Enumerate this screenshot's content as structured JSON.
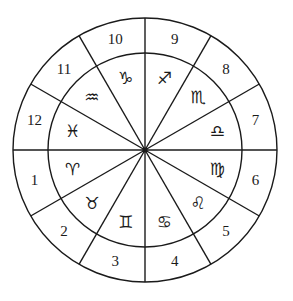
{
  "diagram": {
    "title": "",
    "type": "astrological-house-wheel",
    "center": [
      145,
      150
    ],
    "outer_radius": 132,
    "inner_radius": 97,
    "line_color": "#1a1a1a",
    "houses": [
      {
        "label": "1",
        "angle_deg": 195
      },
      {
        "label": "2",
        "angle_deg": 225
      },
      {
        "label": "3",
        "angle_deg": 255
      },
      {
        "label": "4",
        "angle_deg": 285
      },
      {
        "label": "5",
        "angle_deg": 315
      },
      {
        "label": "6",
        "angle_deg": 345
      },
      {
        "label": "7",
        "angle_deg": 15
      },
      {
        "label": "8",
        "angle_deg": 45
      },
      {
        "label": "9",
        "angle_deg": 75
      },
      {
        "label": "10",
        "angle_deg": 105
      },
      {
        "label": "11",
        "angle_deg": 135
      },
      {
        "label": "12",
        "angle_deg": 165
      }
    ],
    "signs": [
      {
        "name": "aries",
        "glyph": "♈",
        "angle_deg": 195
      },
      {
        "name": "taurus",
        "glyph": "♉",
        "angle_deg": 225
      },
      {
        "name": "gemini",
        "glyph": "♊",
        "angle_deg": 255
      },
      {
        "name": "cancer",
        "glyph": "♋",
        "angle_deg": 285
      },
      {
        "name": "leo",
        "glyph": "♌",
        "angle_deg": 315
      },
      {
        "name": "virgo",
        "glyph": "♍",
        "angle_deg": 345
      },
      {
        "name": "libra",
        "glyph": "♎",
        "angle_deg": 15
      },
      {
        "name": "scorpio",
        "glyph": "♏",
        "angle_deg": 45
      },
      {
        "name": "sagittarius",
        "glyph": "♐",
        "angle_deg": 75
      },
      {
        "name": "capricorn",
        "glyph": "♑",
        "angle_deg": 105
      },
      {
        "name": "aquarius",
        "glyph": "♒",
        "angle_deg": 135
      },
      {
        "name": "pisces",
        "glyph": "♓",
        "angle_deg": 165
      }
    ]
  }
}
